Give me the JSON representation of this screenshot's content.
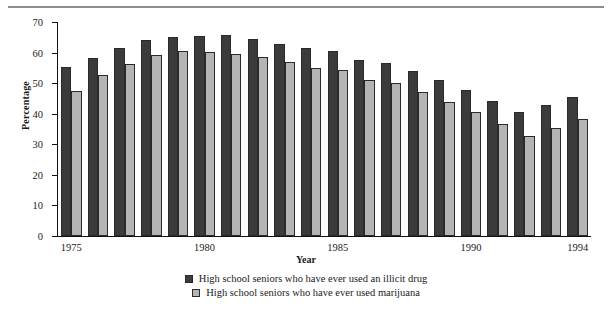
{
  "chart_data": {
    "type": "bar",
    "title": "",
    "xlabel": "Year",
    "ylabel": "Percentage",
    "ylim": [
      0,
      70
    ],
    "yticks": [
      0,
      10,
      20,
      30,
      40,
      50,
      60,
      70
    ],
    "xtick_labels": [
      "1975",
      "1980",
      "1985",
      "1990",
      "1994"
    ],
    "grid": false,
    "legend_position": "bottom",
    "categories": [
      "1975",
      "1976",
      "1977",
      "1978",
      "1979",
      "1980",
      "1981",
      "1982",
      "1983",
      "1984",
      "1985",
      "1986",
      "1987",
      "1988",
      "1989",
      "1990",
      "1991",
      "1992",
      "1993",
      "1994"
    ],
    "series": [
      {
        "name": "High school seniors who have ever used an illicit drug",
        "color": "#3b3b3b",
        "values": [
          55.2,
          58.3,
          61.6,
          64.1,
          65.1,
          65.4,
          65.6,
          64.4,
          62.9,
          61.6,
          60.6,
          57.6,
          56.6,
          53.9,
          50.9,
          47.9,
          44.1,
          40.7,
          42.9,
          45.6
        ]
      },
      {
        "name": "High school seniors who have ever used marijuana",
        "color": "#b4b4b4",
        "values": [
          47.3,
          52.8,
          56.4,
          59.2,
          60.4,
          60.3,
          59.5,
          58.7,
          57.0,
          54.9,
          54.2,
          50.9,
          50.2,
          47.2,
          43.7,
          40.7,
          36.7,
          32.6,
          35.3,
          38.2
        ]
      }
    ]
  },
  "legend": [
    {
      "label": "High school seniors who have ever used an illicit drug",
      "swatch": "dark"
    },
    {
      "label": "High school seniors who have ever used marijuana",
      "swatch": "light"
    }
  ],
  "axes": {
    "y_title": "Percentage",
    "x_title": "Year"
  }
}
